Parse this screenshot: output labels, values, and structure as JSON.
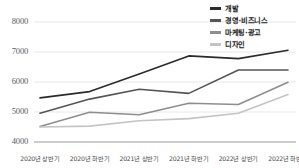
{
  "chart_data": {
    "type": "line",
    "title": "",
    "xlabel": "",
    "ylabel": "",
    "ylim": [
      4000,
      8000
    ],
    "yticks": [
      4000,
      5000,
      6000,
      7000,
      8000
    ],
    "grid": true,
    "legend_position": "top-right",
    "categories": [
      "2020년 상반기",
      "2020년 하반기",
      "2021년 상반기",
      "2021년 하반기",
      "2022년 상반기",
      "2022년 하반기"
    ],
    "series": [
      {
        "name": "개발",
        "color": "#2b2b2b",
        "values": [
          5470,
          5680,
          6270,
          6870,
          6780,
          7060
        ]
      },
      {
        "name": "경영·비즈니스",
        "color": "#555555",
        "values": [
          4960,
          5430,
          5760,
          5620,
          6400,
          6400
        ]
      },
      {
        "name": "마케팅·광고",
        "color": "#8e8e8e",
        "values": [
          4520,
          4990,
          4910,
          5290,
          5250,
          5990
        ]
      },
      {
        "name": "디자인",
        "color": "#c4c4c4",
        "values": [
          4500,
          4530,
          4710,
          4780,
          4960,
          5580
        ]
      }
    ]
  },
  "legend": {
    "items": [
      {
        "label": "개발",
        "color": "#2b2b2b"
      },
      {
        "label": "경영·비즈니스",
        "color": "#555555"
      },
      {
        "label": "마케팅·광고",
        "color": "#8e8e8e"
      },
      {
        "label": "디자인",
        "color": "#c4c4c4"
      }
    ]
  },
  "axis": {
    "y_labels": [
      "8000",
      "7000",
      "6000",
      "5000",
      "4000"
    ],
    "x_labels": [
      "2020년 상반기",
      "2020년 하반기",
      "2021년 상반기",
      "2021년 하반기",
      "2022년 상반기",
      "2022년 하반기"
    ]
  }
}
